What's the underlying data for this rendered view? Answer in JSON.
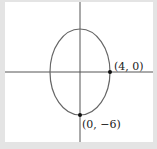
{
  "figure": {
    "shape": "ellipse",
    "center": [
      0,
      0
    ],
    "semi_axis_x": 4,
    "semi_axis_y": 6,
    "points": [
      {
        "label": "(4, 0)",
        "x": 4,
        "y": 0
      },
      {
        "label": "(0, −6)",
        "x": 0,
        "y": -6
      }
    ],
    "colors": {
      "background": "#ffffff",
      "frame": "#e4e4e4",
      "axes": "#555555",
      "curve": "#666666",
      "point": "#111111"
    }
  }
}
